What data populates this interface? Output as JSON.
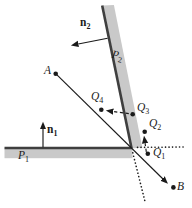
{
  "figure": {
    "colors": {
      "background": "#ffffff",
      "plane_fill": "#c9c9c9",
      "plane_edge": "#3f3f3f",
      "ink": "#1a1a1a"
    }
  },
  "labels": {
    "plane1": {
      "main": "P",
      "sub": "1"
    },
    "plane2": {
      "main": "P",
      "sub": "2"
    },
    "normal1": {
      "main": "n",
      "sub": "1"
    },
    "normal2": {
      "main": "n",
      "sub": "2"
    },
    "point_a": {
      "main": "A",
      "sub": ""
    },
    "point_b": {
      "main": "B",
      "sub": ""
    },
    "q1": {
      "main": "Q",
      "sub": "1"
    },
    "q2": {
      "main": "Q",
      "sub": "2"
    },
    "q3": {
      "main": "Q",
      "sub": "3"
    },
    "q4": {
      "main": "Q",
      "sub": "4"
    }
  },
  "geometry": {
    "points": {
      "A": [
        56,
        74
      ],
      "B": [
        173,
        187
      ],
      "Q1": [
        148,
        154
      ],
      "Q2": [
        145,
        132
      ],
      "Q3": [
        133,
        114
      ],
      "Q4": [
        101,
        110
      ],
      "corner": [
        132,
        148
      ]
    },
    "planes": {
      "P1": "horizontal slab, surface y=148, from x=5 to corner",
      "P2": "tilted slab, surface from (102,6) to corner (132,148)"
    },
    "arrows": {
      "n1": "normal of P1, points up from (43,147) to (43,122)",
      "n2": "normal of P2, points left from (108,38) to (71,45)",
      "ray": "solid line from A through corner toward B, arrowhead near B",
      "dashed_q3_q4": "dashed arrow from Q3 toward Q4",
      "dashed_q1_q2": "dashed arrow from Q1 toward Q2",
      "dotted_p1_ext": "dotted extension of P1 surface to the right of corner",
      "dotted_p2_ext": "dotted extension of P2 surface below corner"
    }
  }
}
